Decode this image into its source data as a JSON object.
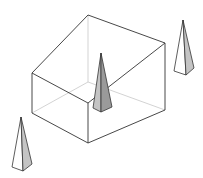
{
  "diagram": {
    "title": "",
    "colors": {
      "background": "#ffffff",
      "edge": "#333333",
      "hidden_edge": "#c8c8c8",
      "pyramid_light_face": "#ffffff",
      "pyramid_shaded_face": "#c4c4c4",
      "pyramid_dark_face": "#9a9a9a"
    },
    "box": {
      "label": "",
      "visible_edges": [
        [
          88,
          15,
          165,
          43
        ],
        [
          88,
          15,
          32,
          73
        ],
        [
          32,
          73,
          88,
          103
        ],
        [
          88,
          103,
          165,
          43
        ],
        [
          32,
          73,
          32,
          113
        ],
        [
          88,
          103,
          88,
          143
        ],
        [
          165,
          43,
          165,
          110
        ],
        [
          32,
          113,
          88,
          143
        ],
        [
          88,
          143,
          165,
          110
        ]
      ],
      "hidden_edges": [
        [
          88,
          15,
          88,
          82
        ],
        [
          88,
          82,
          32,
          113
        ],
        [
          88,
          82,
          165,
          110
        ]
      ]
    },
    "pyramids": [
      {
        "id": "center",
        "label": "",
        "apex": [
          101,
          53
        ],
        "faces": {
          "left": "101,53 93,108 101,112",
          "right": "101,53 101,112 112,107"
        }
      },
      {
        "id": "right",
        "label": "",
        "apex": [
          183,
          20
        ],
        "faces": {
          "left": "183,20 174,71 186,75",
          "right": "183,20 186,75 194,68"
        }
      },
      {
        "id": "bottom-left",
        "label": "",
        "apex": [
          21,
          117
        ],
        "faces": {
          "left": "21,117 12,167 23,171",
          "right": "21,117 23,171 32,164"
        }
      }
    ]
  }
}
